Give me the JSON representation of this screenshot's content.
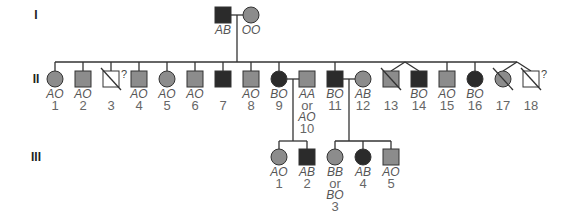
{
  "colors": {
    "affected_dark": "#2b2b2b",
    "carrier_gray": "#8c8c8c",
    "unknown_white": "#ffffff",
    "line": "#333333"
  },
  "legend_markers": {
    "diagonal_slash": "deceased",
    "question_mark": "unknown status"
  },
  "generations": [
    {
      "roman": "I",
      "members": [
        {
          "id": "I-1",
          "sex": "male",
          "fill": "dark",
          "genotype": [
            "AB"
          ],
          "number": ""
        },
        {
          "id": "I-2",
          "sex": "female",
          "fill": "gray",
          "genotype": [
            "OO"
          ],
          "number": ""
        }
      ]
    },
    {
      "roman": "II",
      "members": [
        {
          "id": "II-1",
          "sex": "female",
          "fill": "gray",
          "genotype": [
            "AO"
          ],
          "number": "1"
        },
        {
          "id": "II-2",
          "sex": "male",
          "fill": "gray",
          "genotype": [
            "AO"
          ],
          "number": "2"
        },
        {
          "id": "II-3",
          "sex": "male",
          "fill": "white",
          "genotype": [],
          "number": "3",
          "deceased": true,
          "unknown": true
        },
        {
          "id": "II-4",
          "sex": "male",
          "fill": "gray",
          "genotype": [
            "AO"
          ],
          "number": "4"
        },
        {
          "id": "II-5",
          "sex": "female",
          "fill": "gray",
          "genotype": [
            "AO"
          ],
          "number": "5"
        },
        {
          "id": "II-6",
          "sex": "male",
          "fill": "gray",
          "genotype": [
            "AO"
          ],
          "number": "6"
        },
        {
          "id": "II-7",
          "sex": "male",
          "fill": "dark",
          "genotype": [],
          "number": "7"
        },
        {
          "id": "II-8",
          "sex": "male",
          "fill": "gray",
          "genotype": [
            "AO"
          ],
          "number": "8"
        },
        {
          "id": "II-9",
          "sex": "female",
          "fill": "dark",
          "genotype": [
            "BO"
          ],
          "number": "9"
        },
        {
          "id": "II-10",
          "sex": "male",
          "fill": "gray",
          "genotype": [
            "AA",
            "or",
            "AO"
          ],
          "number": "10",
          "spouse": true
        },
        {
          "id": "II-11",
          "sex": "male",
          "fill": "dark",
          "genotype": [
            "BO"
          ],
          "number": "11"
        },
        {
          "id": "II-12",
          "sex": "female",
          "fill": "gray",
          "genotype": [
            "AB"
          ],
          "number": "12",
          "spouse": true
        },
        {
          "id": "II-13",
          "sex": "male",
          "fill": "gray",
          "genotype": [],
          "number": "13",
          "deceased": true,
          "twin_group": "a"
        },
        {
          "id": "II-14",
          "sex": "male",
          "fill": "dark",
          "genotype": [
            "BO"
          ],
          "number": "14",
          "twin_group": "a"
        },
        {
          "id": "II-15",
          "sex": "male",
          "fill": "gray",
          "genotype": [
            "AO"
          ],
          "number": "15"
        },
        {
          "id": "II-16",
          "sex": "female",
          "fill": "dark",
          "genotype": [
            "BO"
          ],
          "number": "16"
        },
        {
          "id": "II-17",
          "sex": "female",
          "fill": "gray",
          "genotype": [],
          "number": "17",
          "deceased": true,
          "twin_group": "b"
        },
        {
          "id": "II-18",
          "sex": "male",
          "fill": "white",
          "genotype": [],
          "number": "18",
          "deceased": true,
          "unknown": true,
          "twin_group": "b"
        }
      ]
    },
    {
      "roman": "III",
      "members": [
        {
          "id": "III-1",
          "sex": "female",
          "fill": "gray",
          "genotype": [
            "AO"
          ],
          "number": "1",
          "parents": [
            "II-9",
            "II-10"
          ]
        },
        {
          "id": "III-2",
          "sex": "male",
          "fill": "dark",
          "genotype": [
            "AB"
          ],
          "number": "2",
          "parents": [
            "II-9",
            "II-10"
          ]
        },
        {
          "id": "III-3",
          "sex": "female",
          "fill": "gray",
          "genotype": [
            "BB",
            "or",
            "BO"
          ],
          "number": "3",
          "parents": [
            "II-11",
            "II-12"
          ]
        },
        {
          "id": "III-4",
          "sex": "female",
          "fill": "dark",
          "genotype": [
            "AB"
          ],
          "number": "4",
          "parents": [
            "II-11",
            "II-12"
          ]
        },
        {
          "id": "III-5",
          "sex": "male",
          "fill": "gray",
          "genotype": [
            "AO"
          ],
          "number": "5",
          "parents": [
            "II-11",
            "II-12"
          ]
        }
      ]
    }
  ],
  "marriages": [
    {
      "partners": [
        "I-1",
        "I-2"
      ],
      "children_generation": "II",
      "children": [
        "II-1",
        "II-2",
        "II-3",
        "II-4",
        "II-5",
        "II-6",
        "II-7",
        "II-8",
        "II-9",
        "II-11",
        "II-13",
        "II-14",
        "II-15",
        "II-16",
        "II-17",
        "II-18"
      ]
    },
    {
      "partners": [
        "II-9",
        "II-10"
      ],
      "children": [
        "III-1",
        "III-2"
      ]
    },
    {
      "partners": [
        "II-11",
        "II-12"
      ],
      "children": [
        "III-3",
        "III-4",
        "III-5"
      ]
    }
  ],
  "unknown_mark": "?"
}
